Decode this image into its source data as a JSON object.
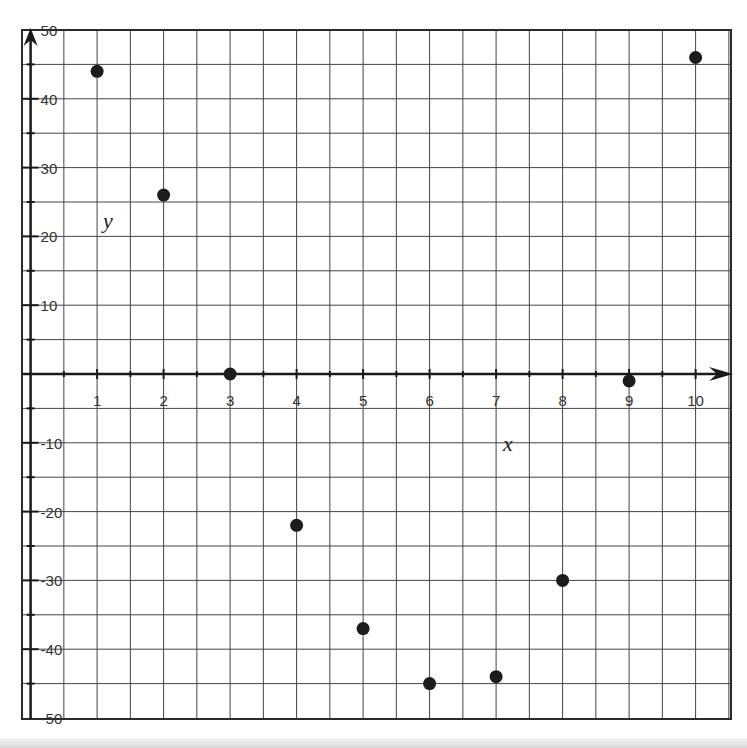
{
  "chart_data": {
    "type": "scatter",
    "title": "",
    "xlabel": "x",
    "ylabel": "y",
    "xlim": [
      0,
      10.5
    ],
    "ylim": [
      -50,
      50
    ],
    "grid": true,
    "legend": null,
    "x_ticks": [
      "1",
      "2",
      "3",
      "4",
      "5",
      "6",
      "7",
      "8",
      "9",
      "10"
    ],
    "y_ticks": [
      "50",
      "40",
      "30",
      "20",
      "10",
      "-10",
      "-20",
      "-30",
      "-40",
      "-50"
    ],
    "series": [
      {
        "name": "points",
        "points": [
          {
            "x": 1,
            "y": 44
          },
          {
            "x": 2,
            "y": 26
          },
          {
            "x": 3,
            "y": 0
          },
          {
            "x": 4,
            "y": -22
          },
          {
            "x": 5,
            "y": -37
          },
          {
            "x": 6,
            "y": -45
          },
          {
            "x": 7,
            "y": -44
          },
          {
            "x": 8,
            "y": -30
          },
          {
            "x": 9,
            "y": -1
          },
          {
            "x": 10,
            "y": 46
          }
        ]
      }
    ]
  },
  "colors": {
    "ink": "#1a1a1a",
    "grid": "#444444",
    "point": "#1c1c1c"
  }
}
